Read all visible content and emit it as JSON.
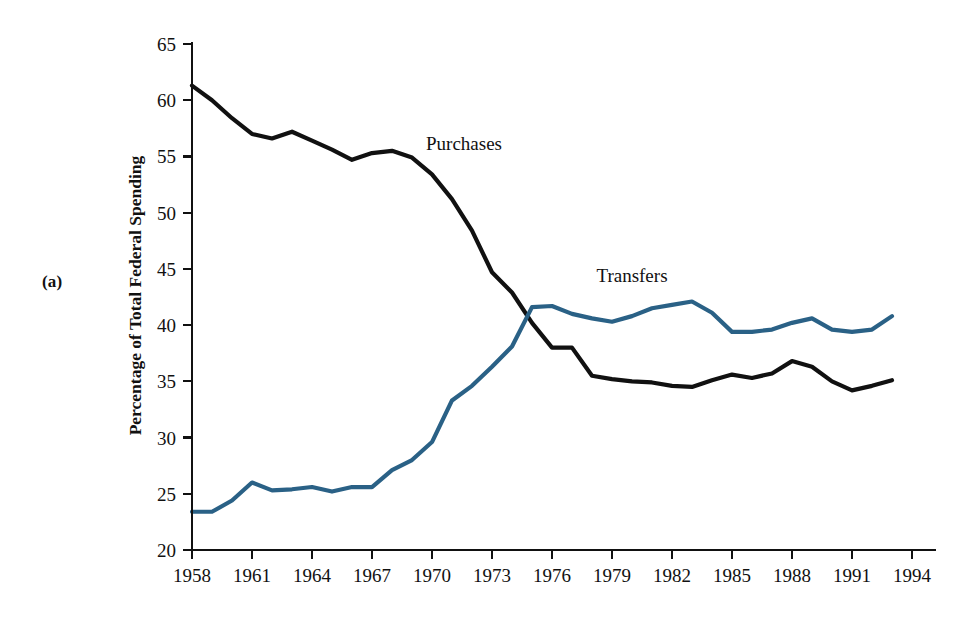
{
  "figure": {
    "panel_label": "(a)",
    "y_axis_title": "Percentage of Total Federal Spending"
  },
  "chart_data": {
    "type": "line",
    "title": "",
    "subtitle": "",
    "xlabel": "",
    "ylabel": "Percentage of Total Federal Spending",
    "xlim": [
      1958,
      1994
    ],
    "ylim": [
      20,
      65
    ],
    "xticks": [
      1958,
      1961,
      1964,
      1967,
      1970,
      1973,
      1976,
      1979,
      1982,
      1985,
      1988,
      1991,
      1994
    ],
    "yticks": [
      20,
      25,
      30,
      35,
      40,
      45,
      50,
      55,
      60,
      65
    ],
    "grid": false,
    "legend_position": "inline-annotations",
    "x": [
      1958,
      1959,
      1960,
      1961,
      1962,
      1963,
      1964,
      1965,
      1966,
      1967,
      1968,
      1969,
      1970,
      1971,
      1972,
      1973,
      1974,
      1975,
      1976,
      1977,
      1978,
      1979,
      1980,
      1981,
      1982,
      1983,
      1984,
      1985,
      1986,
      1987,
      1988,
      1989,
      1990,
      1991,
      1992,
      1993
    ],
    "series": [
      {
        "name": "Purchases",
        "color": "#111111",
        "label_x": 1971.6,
        "label_y": 55.6,
        "values": [
          61.3,
          60.0,
          58.4,
          57.0,
          56.6,
          57.2,
          56.4,
          55.6,
          54.7,
          55.3,
          55.5,
          54.9,
          53.4,
          51.2,
          48.4,
          44.7,
          42.9,
          40.2,
          38.0,
          38.0,
          35.5,
          35.2,
          35.0,
          34.9,
          34.6,
          34.5,
          35.1,
          35.6,
          35.3,
          35.7,
          36.8,
          36.3,
          35.0,
          34.2,
          34.6,
          35.1
        ]
      },
      {
        "name": "Transfers",
        "color": "#2a6186",
        "label_x": 1980.0,
        "label_y": 43.8,
        "values": [
          23.4,
          23.4,
          24.4,
          26.0,
          25.3,
          25.4,
          25.6,
          25.2,
          25.6,
          25.6,
          27.1,
          28.0,
          29.6,
          33.3,
          34.6,
          36.3,
          38.1,
          41.6,
          41.7,
          41.0,
          40.6,
          40.3,
          40.8,
          41.5,
          41.8,
          42.1,
          41.1,
          39.4,
          39.4,
          39.6,
          40.2,
          40.6,
          39.6,
          39.4,
          39.6,
          40.8
        ]
      }
    ]
  }
}
